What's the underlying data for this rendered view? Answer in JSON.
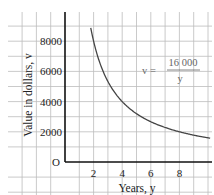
{
  "chart_data": {
    "type": "line",
    "title": "",
    "xlabel": "Years, y",
    "ylabel": "Value in dollars, v",
    "xlim": [
      0,
      10.3
    ],
    "ylim": [
      0,
      9000
    ],
    "grid": true,
    "x_ticks": [
      "2",
      "4",
      "6",
      "8"
    ],
    "y_ticks": [
      "2000",
      "4000",
      "6000",
      "8000"
    ],
    "origin_label": "O",
    "annotation": {
      "lhs": "v =",
      "numerator": "16 000",
      "denominator": "y"
    },
    "series": [
      {
        "name": "v = 16000 / y",
        "x": [
          1.8,
          2,
          3,
          4,
          5,
          6,
          7,
          8,
          9,
          10.2
        ],
        "values": [
          8889,
          8000,
          5333,
          4000,
          3200,
          2667,
          2286,
          2000,
          1778,
          1569
        ]
      }
    ],
    "colors": {
      "curve": "#444444",
      "grid": "#bdbdbd",
      "axis": "#111111"
    }
  }
}
